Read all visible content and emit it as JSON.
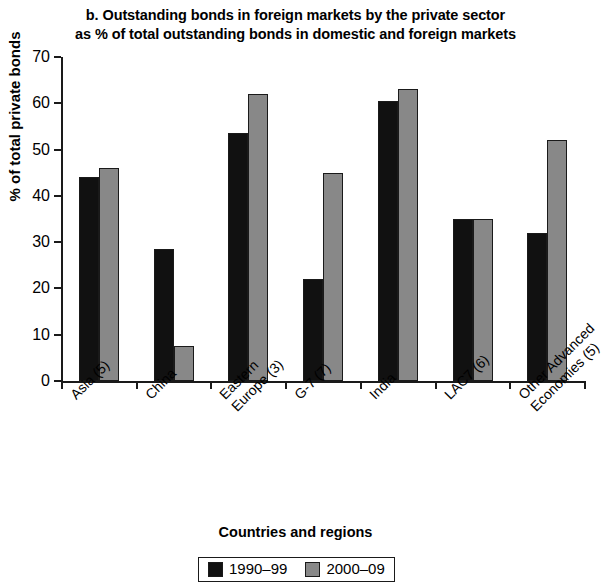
{
  "chart_data": {
    "type": "bar",
    "title": "b. Outstanding bonds in foreign markets by the private sector as % of total outstanding bonds in domestic and foreign markets",
    "title_lines": [
      "b. Outstanding bonds in foreign markets by the private sector",
      "as % of total outstanding bonds in domestic and foreign markets"
    ],
    "xlabel": "Countries and regions",
    "ylabel": "% of total private bonds",
    "ylim": [
      0,
      70
    ],
    "yticks": [
      0,
      10,
      20,
      30,
      40,
      50,
      60,
      70
    ],
    "ytick_labels": [
      "0",
      "10",
      "20",
      "30",
      "40",
      "50",
      "60",
      "70"
    ],
    "grid": false,
    "legend_position": "bottom",
    "categories": [
      "Asia (5)",
      "China",
      "Eastern Europe (3)",
      "G-7 (7)",
      "India",
      "LAC7 (6)",
      "Other Advanced Economies (5)"
    ],
    "category_label_lines": [
      [
        "Asia (5)"
      ],
      [
        "China"
      ],
      [
        "Eastern",
        "Europe (3)"
      ],
      [
        "G-7 (7)"
      ],
      [
        "India"
      ],
      [
        "LAC7 (6)"
      ],
      [
        "Other Advanced",
        "Economies (5)"
      ]
    ],
    "series": [
      {
        "name": "1990–99",
        "color": "#111111",
        "values": [
          44.0,
          28.5,
          53.5,
          22.0,
          60.5,
          35.0,
          32.0
        ]
      },
      {
        "name": "2000–09",
        "color": "#888888",
        "values": [
          46.0,
          7.5,
          62.0,
          45.0,
          63.0,
          35.0,
          52.0
        ]
      }
    ]
  },
  "legend": {
    "items": [
      {
        "label": "1990–99",
        "color": "#111111"
      },
      {
        "label": "2000–09",
        "color": "#888888"
      }
    ]
  }
}
